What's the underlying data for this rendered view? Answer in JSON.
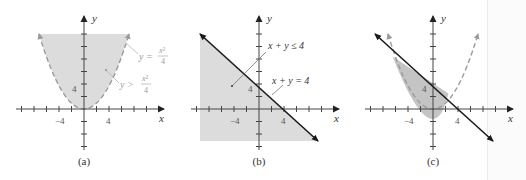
{
  "figure": {
    "panels": [
      {
        "id": "a",
        "caption": "(a)",
        "axis_x_label": "x",
        "axis_y_label": "y",
        "tick_label_x_neg": "−4",
        "tick_label_x_pos": "4",
        "tick_label_y": "4",
        "curve_label_eq": "y =",
        "curve_label_eq_num": "x²",
        "curve_label_eq_den": "4",
        "region_label_ineq": "y >",
        "region_label_ineq_num": "x²",
        "region_label_ineq_den": "4"
      },
      {
        "id": "b",
        "caption": "(b)",
        "axis_x_label": "x",
        "axis_y_label": "y",
        "tick_label_x_neg": "−4",
        "tick_label_x_pos": "4",
        "tick_label_y": "4",
        "region_label": "x + y ≤ 4",
        "line_label": "x + y = 4"
      },
      {
        "id": "c",
        "caption": "(c)",
        "axis_x_label": "x",
        "axis_y_label": "y",
        "tick_label_x_neg": "−4",
        "tick_label_x_pos": "4",
        "tick_label_y": "4"
      }
    ],
    "colors": {
      "shade": "#dcdcdc",
      "shade_dark": "#c4c4c4",
      "axis": "#444444",
      "line": "#1a1a1a",
      "dashed_curve": "#9a9a9a",
      "label_light": "#9a9a9a",
      "label_dark": "#333333"
    }
  }
}
